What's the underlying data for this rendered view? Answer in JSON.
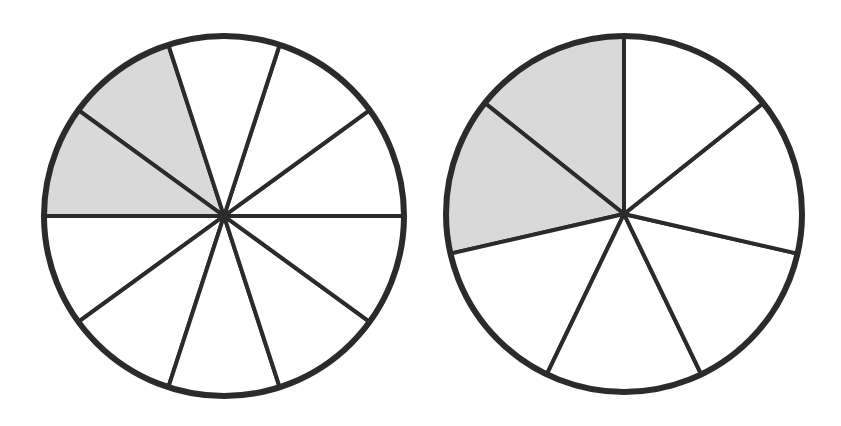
{
  "colors": {
    "stroke": "#2b2b2b",
    "shaded": "#d9d9d9",
    "unshaded": "#ffffff",
    "background": "#ffffff"
  },
  "circles": [
    {
      "id": "left",
      "cx": 224,
      "cy": 216,
      "r": 180,
      "slices": 10,
      "shaded": 2,
      "start_angle_deg": 108,
      "shaded_indices": [
        0,
        1
      ]
    },
    {
      "id": "right",
      "cx": 624,
      "cy": 214,
      "r": 178,
      "slices": 7,
      "shaded": 2,
      "start_angle_deg": 90,
      "shaded_indices": [
        0,
        1
      ]
    }
  ]
}
